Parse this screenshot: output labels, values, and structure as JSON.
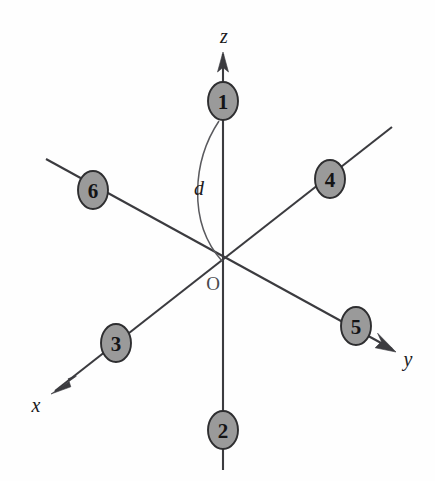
{
  "figure": {
    "background_color": "#fefefe",
    "width": 435,
    "height": 481
  },
  "colors": {
    "node_fill": "#9a9a9a",
    "node_stroke": "#2e2e30",
    "axis_stroke": "#3b3b3f",
    "arc_stroke": "#5a5a5e",
    "text": "#141416"
  },
  "axes": [
    {
      "id": "z",
      "label": "z",
      "label_x": 224,
      "label_y": 36,
      "has_arrow": true,
      "arrow_tip_x": 223,
      "arrow_tip_y": 52,
      "direction": "up"
    },
    {
      "id": "y",
      "label": "y",
      "label_x": 408,
      "label_y": 359,
      "has_arrow": true,
      "arrow_tip_x": 396,
      "arrow_tip_y": 352,
      "direction": "lower-right"
    },
    {
      "id": "x",
      "label": "x",
      "label_x": 36,
      "label_y": 405,
      "has_arrow": true,
      "arrow_tip_x": 51,
      "arrow_tip_y": 394,
      "direction": "lower-left"
    }
  ],
  "origin": {
    "label": "O",
    "x": 223,
    "y": 262,
    "label_x": 213,
    "label_y": 283
  },
  "angle": {
    "label": "d",
    "label_x": 199,
    "label_y": 188,
    "description": "arc from ligand 1 down to the origin"
  },
  "nodes": [
    {
      "id": 1,
      "label": "1",
      "cx": 223,
      "cy": 101,
      "rx": 15,
      "ry": 19,
      "axis": "z",
      "position": "+z"
    },
    {
      "id": 2,
      "label": "2",
      "cx": 223,
      "cy": 430,
      "rx": 15,
      "ry": 19,
      "axis": "z",
      "position": "-z"
    },
    {
      "id": 3,
      "label": "3",
      "cx": 116,
      "cy": 343,
      "rx": 15,
      "ry": 19,
      "axis": "x",
      "position": "+x"
    },
    {
      "id": 4,
      "label": "4",
      "cx": 330,
      "cy": 179,
      "rx": 15,
      "ry": 19,
      "axis": "x",
      "position": "-x"
    },
    {
      "id": 5,
      "label": "5",
      "cx": 356,
      "cy": 326,
      "rx": 15,
      "ry": 19,
      "axis": "y",
      "position": "+y"
    },
    {
      "id": 6,
      "label": "6",
      "cx": 93,
      "cy": 190,
      "rx": 15,
      "ry": 19,
      "axis": "y",
      "position": "-y"
    }
  ]
}
